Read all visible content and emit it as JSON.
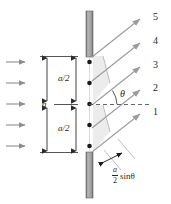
{
  "figure": {
    "type": "single-slit-diffraction-ray-diagram",
    "barrier_color": "#9a9a9a",
    "ray_color": "#a0a0a0",
    "dot_color": "#1a1a1a",
    "text_color": "#2b2b2b",
    "wedge_fill": "#e8e8e8"
  },
  "ray_labels": [
    {
      "id": "ray-5",
      "text": "5"
    },
    {
      "id": "ray-4",
      "text": "4"
    },
    {
      "id": "ray-3",
      "text": "3"
    },
    {
      "id": "ray-2",
      "text": "2"
    },
    {
      "id": "ray-1",
      "text": "1"
    }
  ],
  "dimensions": {
    "full_label": "a",
    "half_label_top": "a/2",
    "half_label_bottom": "a/2"
  },
  "angle": {
    "label": "θ"
  },
  "path_difference": {
    "numerator": "a",
    "denominator": "2",
    "function": "sin",
    "variable": "θ"
  },
  "incoming_waves": {
    "count": 5,
    "direction": "right"
  },
  "source_points": {
    "count": 5
  },
  "caption": {
    "text": ""
  }
}
